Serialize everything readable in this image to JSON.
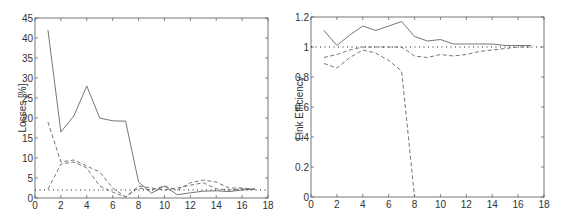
{
  "chart_data": [
    {
      "type": "line",
      "title": "",
      "xlabel": "",
      "ylabel": "Losses [%]",
      "xlim": [
        0,
        18
      ],
      "ylim": [
        0,
        45
      ],
      "xticks": [
        0,
        2,
        4,
        6,
        8,
        10,
        12,
        14,
        16,
        18
      ],
      "yticks": [
        0,
        5,
        10,
        15,
        20,
        25,
        30,
        35,
        40,
        45
      ],
      "grid": false,
      "legend": null,
      "x": [
        1,
        2,
        3,
        4,
        5,
        6,
        7,
        8,
        9,
        10,
        11,
        12,
        13,
        14,
        15,
        16,
        17
      ],
      "series": [
        {
          "name": "solid",
          "style": "solid",
          "values": [
            42,
            16.5,
            20.5,
            28,
            20,
            19.3,
            19.2,
            4,
            1.2,
            3,
            0.8,
            1.3,
            1.7,
            1.8,
            1.6,
            2,
            2.2
          ]
        },
        {
          "name": "dashed-a",
          "style": "dashed",
          "values": [
            19,
            9,
            9.5,
            8,
            6.5,
            2.5,
            0.3,
            2.5,
            2,
            3,
            2,
            3.8,
            4.5,
            4,
            2.5,
            2.5,
            2.2
          ]
        },
        {
          "name": "dashed-b",
          "style": "dashed",
          "values": [
            2.2,
            8.5,
            9,
            7.5,
            3,
            1.5,
            0.2,
            3,
            2.5,
            2,
            2.5,
            3.2,
            3.8,
            2.3,
            2,
            2.3,
            2.2
          ]
        },
        {
          "name": "reference",
          "style": "dotted",
          "values": [
            2,
            2,
            2,
            2,
            2,
            2,
            2,
            2,
            2,
            2,
            2,
            2,
            2,
            2,
            2,
            2,
            2
          ],
          "x_range": [
            0,
            18
          ]
        }
      ]
    },
    {
      "type": "line",
      "title": "",
      "xlabel": "",
      "ylabel": "Link Efficiency",
      "xlim": [
        0,
        18
      ],
      "ylim": [
        0,
        1.2
      ],
      "xticks": [
        0,
        2,
        4,
        6,
        8,
        10,
        12,
        14,
        16,
        18
      ],
      "yticks": [
        0,
        0.2,
        0.4,
        0.6,
        0.8,
        1,
        1.2
      ],
      "grid": false,
      "legend": null,
      "x": [
        1,
        2,
        3,
        4,
        5,
        6,
        7,
        8,
        9,
        10,
        11,
        12,
        13,
        14,
        15,
        16,
        17
      ],
      "series": [
        {
          "name": "solid",
          "style": "solid",
          "values": [
            1.11,
            1.01,
            1.08,
            1.14,
            1.11,
            1.14,
            1.17,
            1.07,
            1.04,
            1.05,
            1.02,
            1.02,
            1.02,
            1.02,
            1.01,
            1.01,
            1.01
          ]
        },
        {
          "name": "dashed-a",
          "style": "dashed",
          "values": [
            0.93,
            0.95,
            0.98,
            1.0,
            1.0,
            1.0,
            1.0,
            0.94,
            0.93,
            0.95,
            0.94,
            0.95,
            0.97,
            0.98,
            0.99,
            1.0,
            1.0
          ]
        },
        {
          "name": "dashed-b",
          "style": "dashed",
          "values": [
            0.89,
            0.86,
            0.93,
            0.98,
            0.96,
            0.91,
            0.84,
            0.0
          ]
        },
        {
          "name": "reference",
          "style": "dotted",
          "values": [
            1,
            1
          ],
          "x_range": [
            0,
            18
          ]
        }
      ]
    }
  ],
  "left_plot": {
    "ylabel": "Losses [%]"
  },
  "right_plot": {
    "ylabel": "Link Efficiency"
  }
}
